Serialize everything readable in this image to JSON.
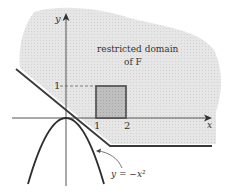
{
  "diagram": {
    "axes": {
      "x_label": "x",
      "y_label": "y",
      "x_ticks": [
        "1",
        "2"
      ],
      "y_ticks": [
        "1"
      ]
    },
    "region_label_line1": "restricted domain",
    "region_label_line2": "of F",
    "curve_label": "y = −x²",
    "colors": {
      "region_fill": "#e4e4e4",
      "square_fill": "#bdbdbd",
      "line": "#3a3a3a",
      "axis": "#555555"
    }
  }
}
